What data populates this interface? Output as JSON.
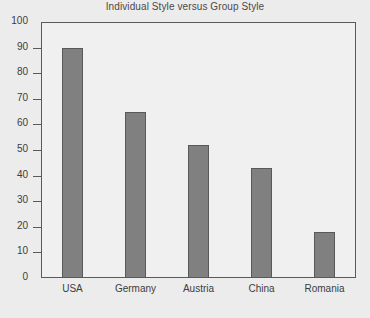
{
  "chart_data": {
    "type": "bar",
    "title": "Individual Style versus Group Style",
    "xlabel": "",
    "ylabel": "",
    "categories": [
      "USA",
      "Germany",
      "Austria",
      "China",
      "Romania"
    ],
    "values": [
      90,
      65,
      52,
      43,
      18
    ],
    "ylim": [
      0,
      100
    ],
    "yticks": [
      0,
      10,
      20,
      30,
      40,
      50,
      60,
      70,
      80,
      90,
      100
    ],
    "ytick_labels": [
      "0",
      "10",
      "20",
      "30",
      "40",
      "50",
      "60",
      "70",
      "80",
      "90",
      "100"
    ],
    "grid": false,
    "legend": false,
    "legend_position": "none",
    "bar_color": "#808080",
    "bar_edge_color": "#595959",
    "plot_background": "#f0f0f0",
    "figure_background": "#ececec",
    "axis_color": "#5a5a5a",
    "text_color": "#3c3c3c",
    "title_color": "#4a4a4a"
  }
}
